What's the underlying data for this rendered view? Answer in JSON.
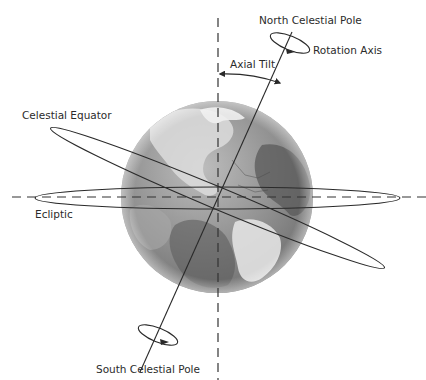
{
  "diagram": {
    "type": "Earth axial tilt diagram",
    "labels": {
      "north_pole": "North Celestial Pole",
      "rotation_axis": "Rotation Axis",
      "axial_tilt": "Axial Tilt",
      "celestial_equator": "Celestial Equator",
      "ecliptic": "Ecliptic",
      "south_pole": "South Celestial Pole"
    },
    "colors": {
      "background": "#ffffff",
      "lines": "#2a2a2a",
      "globe_light": "#e6e6e6",
      "globe_mid": "#9a9a9a",
      "globe_dark": "#555555"
    },
    "geometry": {
      "globe_center": [
        217,
        197
      ],
      "globe_radius": 96,
      "axial_tilt_degrees": 23.5
    }
  }
}
